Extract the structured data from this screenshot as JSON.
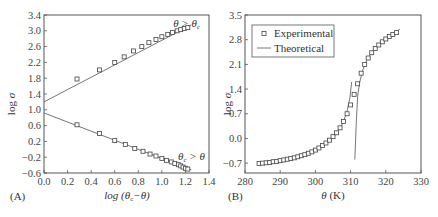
{
  "chart_data": [
    {
      "panel": "(A)",
      "type": "scatter",
      "xlabel": "log (θc−θ)",
      "ylabel": "log σ",
      "xlim": [
        0.0,
        1.4
      ],
      "ylim": [
        -0.6,
        3.4
      ],
      "xticks": [
        "0.0",
        "0.2",
        "0.4",
        "0.6",
        "0.8",
        "1.0",
        "1.2",
        "1.4"
      ],
      "yticks": [
        "-0.6",
        "-0.2",
        "0.2",
        "0.6",
        "1.0",
        "1.4",
        "1.8",
        "2.2",
        "2.6",
        "3.0",
        "3.4"
      ],
      "annotations": [
        "θ > θc",
        "θc > θ"
      ],
      "series": [
        {
          "name": "θ > θc (data)",
          "marker": "square-open",
          "x": [
            0.28,
            0.47,
            0.6,
            0.68,
            0.76,
            0.83,
            0.89,
            0.95,
            1.0,
            1.05,
            1.09,
            1.13,
            1.16,
            1.19,
            1.22
          ],
          "y": [
            1.78,
            2.01,
            2.2,
            2.34,
            2.49,
            2.6,
            2.7,
            2.78,
            2.85,
            2.91,
            2.96,
            3.0,
            3.03,
            3.06,
            3.08
          ]
        },
        {
          "name": "θ > θc (fit)",
          "type": "line",
          "x": [
            0.0,
            1.25
          ],
          "y": [
            1.2,
            3.15
          ]
        },
        {
          "name": "θc > θ (data)",
          "marker": "square-open",
          "x": [
            0.28,
            0.47,
            0.6,
            0.69,
            0.77,
            0.84,
            0.9,
            0.95,
            1.0,
            1.04,
            1.08,
            1.11,
            1.14,
            1.16,
            1.18,
            1.2,
            1.22
          ],
          "y": [
            0.62,
            0.4,
            0.22,
            0.12,
            0.02,
            -0.05,
            -0.12,
            -0.17,
            -0.23,
            -0.28,
            -0.32,
            -0.36,
            -0.39,
            -0.42,
            -0.45,
            -0.48,
            -0.5
          ]
        },
        {
          "name": "θc > θ (fit)",
          "type": "line",
          "x": [
            0.0,
            1.25
          ],
          "y": [
            0.92,
            -0.52
          ]
        }
      ]
    },
    {
      "panel": "(B)",
      "type": "scatter",
      "xlabel": "θ (K)",
      "ylabel": "log σ",
      "xlim": [
        280,
        330
      ],
      "ylim": [
        -0.98,
        3.5
      ],
      "xticks": [
        "280",
        "290",
        "300",
        "310",
        "320",
        "330"
      ],
      "yticks": [
        "-0.7",
        "0.0",
        "0.7",
        "1.4",
        "2.1",
        "2.8",
        "3.5"
      ],
      "legend": {
        "position": "upper left",
        "entries": [
          "Experimental",
          "Theoretical"
        ]
      },
      "series": [
        {
          "name": "Experimental",
          "marker": "square-open",
          "x": [
            284,
            285,
            286,
            287,
            288,
            289,
            290,
            291,
            292,
            293,
            294,
            295,
            296,
            297,
            298,
            299,
            300,
            301,
            302,
            303,
            304,
            305,
            306,
            307,
            308,
            309,
            310,
            311,
            312,
            313,
            314,
            315,
            316,
            317,
            318,
            319,
            320,
            321,
            322,
            323
          ],
          "y": [
            -0.71,
            -0.7,
            -0.69,
            -0.68,
            -0.66,
            -0.65,
            -0.63,
            -0.61,
            -0.59,
            -0.57,
            -0.55,
            -0.52,
            -0.49,
            -0.46,
            -0.42,
            -0.38,
            -0.33,
            -0.27,
            -0.2,
            -0.13,
            -0.05,
            0.05,
            0.16,
            0.3,
            0.48,
            0.7,
            0.95,
            1.25,
            1.55,
            1.85,
            2.1,
            2.28,
            2.43,
            2.55,
            2.65,
            2.74,
            2.82,
            2.89,
            2.95,
            3.0
          ]
        },
        {
          "name": "Theoretical (below θc)",
          "type": "line",
          "x": [
            284,
            288,
            292,
            296,
            300,
            303,
            305,
            307,
            308,
            309,
            309.8,
            310.3
          ],
          "y": [
            -0.72,
            -0.67,
            -0.6,
            -0.5,
            -0.34,
            -0.16,
            0.02,
            0.28,
            0.48,
            0.78,
            1.15,
            1.6
          ]
        },
        {
          "name": "Theoretical (above θc)",
          "type": "line",
          "x": [
            311.2,
            311.6,
            312,
            312.6,
            313.5,
            314.5,
            316,
            318,
            320,
            322,
            324
          ],
          "y": [
            -0.6,
            0.4,
            1.2,
            1.6,
            1.95,
            2.2,
            2.45,
            2.67,
            2.84,
            2.97,
            3.1
          ]
        }
      ]
    }
  ],
  "panelA": {
    "label": "(A)",
    "ylabel_log": "log",
    "ylabel_sigma": "σ",
    "xlabel": "log (θ",
    "xlabel_sub": "c",
    "xlabel_end": "−θ)",
    "ann_upper": "θ > θ",
    "ann_upper_sub": "c",
    "ann_lower_theta": "θ",
    "ann_lower_sub": "c",
    "ann_lower_end": " > θ"
  },
  "panelB": {
    "label": "(B)",
    "ylabel_log": "log",
    "ylabel_sigma": "σ",
    "xlabel_theta": "θ",
    "xlabel_unit": " (K)",
    "legend_experimental": "Experimental",
    "legend_theoretical": "Theoretical"
  },
  "colors": {
    "axis": "#555555",
    "marker": "#444444",
    "line": "#666666",
    "text": "#333333"
  }
}
